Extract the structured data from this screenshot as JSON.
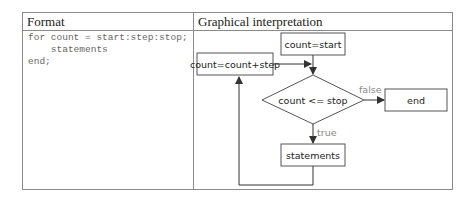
{
  "table": {
    "headers": [
      "Format",
      "Graphical interpretation"
    ],
    "format_code": [
      "for count = start:step:stop;",
      "    statements",
      "end;"
    ]
  },
  "flowchart": {
    "nodes": {
      "init": "count=start",
      "increment": "count=count+step",
      "condition": "count <= stop",
      "end": "end",
      "body": "statements"
    },
    "edge_labels": {
      "false": "false",
      "true": "true"
    }
  }
}
